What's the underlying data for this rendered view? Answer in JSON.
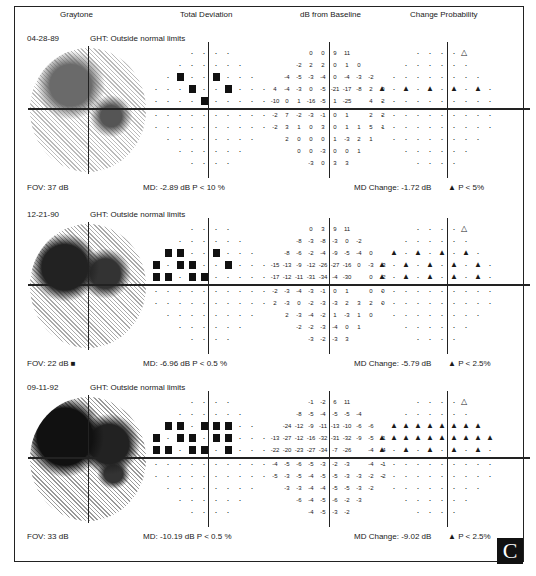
{
  "headers": {
    "graytone": "Graytone",
    "total_deviation": "Total Deviation",
    "db_from_baseline": "dB from Baseline",
    "change_probability": "Change Probability"
  },
  "panels": [
    {
      "date": "04-28-89",
      "ght": "GHT:   Outside normal limits",
      "fov": "FOV:    37 dB",
      "md": "MD: -2.89 dB   P < 10 %",
      "md_change": "MD Change: -1.72 dB",
      "p_change": "▲ P < 5%",
      "db_rows": [
        [
          "0",
          "0",
          "9",
          "11"
        ],
        [
          "-2",
          "2",
          "2",
          "0",
          "1",
          "0"
        ],
        [
          "-4",
          "-5",
          "-3",
          "-4",
          "0",
          "-4",
          "-3",
          "-2"
        ],
        [
          "4",
          "-4",
          "-3",
          "0",
          "-5",
          "-21",
          "-17",
          "-8",
          "2",
          "0"
        ],
        [
          "-10",
          "0",
          "1",
          "-16",
          "-5",
          "1",
          "-25",
          "",
          "4",
          "2"
        ],
        [
          "-2",
          "7",
          "-2",
          "-3",
          "-1",
          "0",
          "1",
          "",
          "2",
          "2"
        ],
        [
          "-2",
          "3",
          "1",
          "0",
          "3",
          "0",
          "1",
          "1",
          "5",
          "1"
        ],
        [
          "2",
          "0",
          "0",
          "0",
          "1",
          "-3",
          "2",
          "1"
        ],
        [
          "0",
          "0",
          "-3",
          "0",
          "0",
          "1"
        ],
        [
          "-3",
          "0",
          "3",
          "3"
        ]
      ]
    },
    {
      "date": "12-21-90",
      "ght": "GHT:   Outside normal limits",
      "fov": "FOV:    22 dB ■",
      "md": "MD: -6.96 dB   P < 0.5 %",
      "md_change": "MD Change: -5.79 dB",
      "p_change": "▲ P < 2.5%",
      "db_rows": [
        [
          "0",
          "3",
          "9",
          "11"
        ],
        [
          "-8",
          "-3",
          "-8",
          "-3",
          "0",
          "-2"
        ],
        [
          "-8",
          "-6",
          "-2",
          "-4",
          "-9",
          "-5",
          "-4",
          "0"
        ],
        [
          "-15",
          "-13",
          "-9",
          "-12",
          "-26",
          "-27",
          "-16",
          "0",
          "-3",
          "-3"
        ],
        [
          "-17",
          "-12",
          "-11",
          "-31",
          "-34",
          "-4",
          "-30",
          "",
          "0",
          "-2"
        ],
        [
          "-2",
          "-3",
          "-4",
          "-3",
          "-1",
          "0",
          "1",
          "",
          "0",
          "0"
        ],
        [
          "2",
          "-3",
          "0",
          "-2",
          "-3",
          "-3",
          "2",
          "3",
          "2",
          "0"
        ],
        [
          "2",
          "-3",
          "-4",
          "-2",
          "1",
          "-3",
          "1",
          "0"
        ],
        [
          "-2",
          "-2",
          "-3",
          "-4",
          "0",
          "1"
        ],
        [
          "-3",
          "-2",
          "-3",
          "3"
        ]
      ]
    },
    {
      "date": "09-11-92",
      "ght": "GHT:   Outside normal limits",
      "fov": "FOV:    33 dB",
      "md": "MD: -10.19 dB   P < 0.5 %",
      "md_change": "MD Change: -9.02 dB",
      "p_change": "▲ P < 2.5%",
      "db_rows": [
        [
          "-1",
          "-2",
          "6",
          "11"
        ],
        [
          "-8",
          "-5",
          "-4",
          "-5",
          "-5",
          "-4"
        ],
        [
          "-24",
          "-12",
          "-9",
          "-11",
          "-13",
          "-10",
          "-6",
          "-6"
        ],
        [
          "-13",
          "-27",
          "-12",
          "-16",
          "-32",
          "-31",
          "-32",
          "-9",
          "-5",
          "-1"
        ],
        [
          "-22",
          "-20",
          "-23",
          "-27",
          "-34",
          "-7",
          "-26",
          "",
          "-4",
          "-4"
        ],
        [
          "-4",
          "-5",
          "-6",
          "-5",
          "-3",
          "-2",
          "-3",
          "",
          "-4",
          "-1"
        ],
        [
          "-5",
          "-3",
          "-5",
          "-4",
          "-5",
          "-5",
          "-3",
          "-3",
          "-2",
          "-2"
        ],
        [
          "-3",
          "-3",
          "-4",
          "-4",
          "-5",
          "-5",
          "-3",
          "-2"
        ],
        [
          "-6",
          "-4",
          "-5",
          "-6",
          "-2",
          "-3"
        ],
        [
          "-4",
          "-5",
          "-3",
          "-2"
        ]
      ]
    }
  ],
  "badge": "C",
  "caption": "Figure 5-14. (C) The change analysis printout..."
}
